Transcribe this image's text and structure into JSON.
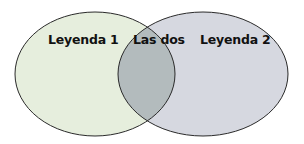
{
  "diagram": {
    "type": "venn",
    "sets": [
      {
        "label": "Leyenda 1",
        "fill": "#e6eedd"
      },
      {
        "label": "Leyenda 2",
        "fill": "#d6d8e0"
      }
    ],
    "intersection": {
      "label": "Las dos",
      "fill": "#b3bbbd"
    },
    "stroke": "#2a2a2a"
  }
}
